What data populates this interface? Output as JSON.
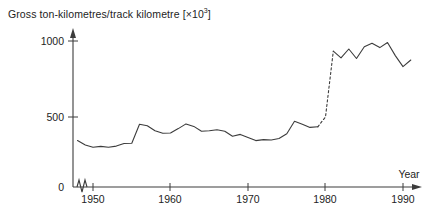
{
  "chart_data": {
    "type": "line",
    "title_plain": "Gross ton-kilometres/track kilometre",
    "title_multiplier": "×10",
    "title_exponent": "3",
    "xlabel": "Year",
    "ylabel": "Gross ton-kilometres/track kilometre [×10³]",
    "xlim": [
      1947,
      1992
    ],
    "ylim": [
      0,
      1060
    ],
    "x_ticks": [
      1950,
      1960,
      1970,
      1980,
      1990
    ],
    "x_tick_labels": [
      "1950",
      "1960",
      "1970",
      "1980",
      "1990"
    ],
    "y_ticks": [
      0,
      500,
      1000
    ],
    "y_tick_labels": [
      "0",
      "500",
      "1000"
    ],
    "grid": false,
    "legend": false,
    "axis_break": {
      "axis": "x",
      "symbol": "zigzag",
      "position_after": "0",
      "note": "broken x-axis between origin and 1948"
    },
    "series": [
      {
        "name": "Gross ton-kilometres per track kilometre",
        "line_style": "solid",
        "color": "#3c3c3c",
        "x": [
          1948,
          1949,
          1950,
          1951,
          1952,
          1953,
          1954,
          1955,
          1956,
          1957,
          1958,
          1959,
          1960,
          1961,
          1962,
          1963,
          1964,
          1965,
          1966,
          1967,
          1968,
          1969,
          1970,
          1971,
          1972,
          1973,
          1974,
          1975,
          1976,
          1977,
          1978,
          1979
        ],
        "values": [
          318,
          288,
          272,
          278,
          272,
          280,
          298,
          300,
          430,
          420,
          385,
          368,
          370,
          400,
          432,
          415,
          382,
          385,
          392,
          382,
          348,
          360,
          340,
          318,
          325,
          322,
          332,
          365,
          450,
          430,
          408,
          412
        ]
      },
      {
        "name": "Discontinuity (1979–1981)",
        "line_style": "dashed",
        "color": "#3c3c3c",
        "x": [
          1979,
          1980,
          1981
        ],
        "values": [
          412,
          480,
          930
        ]
      },
      {
        "name": "Gross ton-kilometres per track kilometre (post-break)",
        "line_style": "solid",
        "color": "#3c3c3c",
        "x": [
          1981,
          1982,
          1983,
          1984,
          1985,
          1986,
          1987,
          1988,
          1989,
          1990,
          1991
        ],
        "values": [
          930,
          885,
          945,
          880,
          960,
          985,
          955,
          990,
          900,
          825,
          870
        ]
      }
    ]
  }
}
